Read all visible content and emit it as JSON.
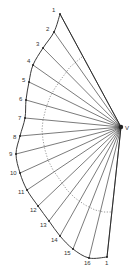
{
  "diagram": {
    "title": "",
    "apex": {
      "label": "V",
      "x": 121,
      "y": 127,
      "label_x": 125,
      "label_y": 130
    },
    "colors": {
      "line": "#222222",
      "dotted": "#555555",
      "text": "#333333"
    },
    "points": [
      {
        "label": "1",
        "x": 60,
        "y": 14,
        "lx": 52,
        "ly": 12
      },
      {
        "label": "2",
        "x": 54,
        "y": 32,
        "lx": 46,
        "ly": 31
      },
      {
        "label": "3",
        "x": 43,
        "y": 48,
        "lx": 36,
        "ly": 46
      },
      {
        "label": "4",
        "x": 33,
        "y": 65,
        "lx": 27,
        "ly": 63
      },
      {
        "label": "5",
        "x": 29,
        "y": 82,
        "lx": 22,
        "ly": 82
      },
      {
        "label": "6",
        "x": 26,
        "y": 100,
        "lx": 19,
        "ly": 101
      },
      {
        "label": "7",
        "x": 25,
        "y": 118,
        "lx": 18,
        "ly": 120
      },
      {
        "label": "8",
        "x": 20,
        "y": 136,
        "lx": 13,
        "ly": 139
      },
      {
        "label": "9",
        "x": 16,
        "y": 154,
        "lx": 9,
        "ly": 156
      },
      {
        "label": "10",
        "x": 20,
        "y": 173,
        "lx": 10,
        "ly": 175
      },
      {
        "label": "11",
        "x": 27,
        "y": 190,
        "lx": 18,
        "ly": 194
      },
      {
        "label": "12",
        "x": 38,
        "y": 206,
        "lx": 30,
        "ly": 212
      },
      {
        "label": "13",
        "x": 49,
        "y": 221,
        "lx": 40,
        "ly": 227
      },
      {
        "label": "14",
        "x": 60,
        "y": 236,
        "lx": 51,
        "ly": 242
      },
      {
        "label": "15",
        "x": 73,
        "y": 249,
        "lx": 64,
        "ly": 255
      },
      {
        "label": "16",
        "x": 89,
        "y": 258,
        "lx": 84,
        "ly": 265
      },
      {
        "label": "1",
        "x": 107,
        "y": 257,
        "lx": 105,
        "ly": 265
      }
    ],
    "dotted_arc": [
      [
        82,
        57
      ],
      [
        70,
        67
      ],
      [
        62,
        78
      ],
      [
        55,
        88
      ],
      [
        50,
        97
      ],
      [
        46,
        108
      ],
      [
        43,
        120
      ],
      [
        42,
        130
      ],
      [
        43,
        140
      ],
      [
        45,
        150
      ],
      [
        48,
        160
      ],
      [
        53,
        170
      ],
      [
        60,
        180
      ],
      [
        67,
        190
      ],
      [
        75,
        198
      ],
      [
        85,
        205
      ],
      [
        95,
        210
      ],
      [
        104,
        212
      ],
      [
        112,
        212
      ]
    ]
  }
}
